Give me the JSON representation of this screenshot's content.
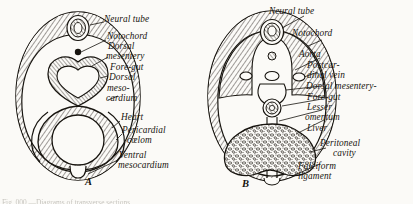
{
  "figure": {
    "panels": [
      {
        "letter": "A",
        "labels": [
          "Neural tube",
          "Notochord",
          "Dorsal",
          "mesentery",
          "Fore-gut",
          "Dorsal",
          "meso-",
          "cardium",
          "Heart",
          "Pericardial",
          "cœlom",
          "Ventral",
          "mesocardium"
        ]
      },
      {
        "letter": "B",
        "labels": [
          "Neural tube",
          "Notochord",
          "Aorta",
          "Postcar-",
          "dinal vein",
          "Dorsal mesentery-",
          "Fore-gut",
          "Lesser",
          "omentum",
          "Liver",
          "Peritoneal",
          "cavity",
          "Falciform",
          "ligament"
        ]
      }
    ],
    "caption": "Fig. 000.—Diagrams of transverse sections"
  },
  "panel_a": {
    "l1": "Neural tube",
    "l2": "Notochord",
    "l3": "Dorsal",
    "l4": "mesentery",
    "l5": "Fore-gut",
    "l6": "Dorsal",
    "l7": "meso-",
    "l8": "cardium",
    "l9": "Heart",
    "l10": "Pericardial",
    "l11": "cœlom",
    "l12": "Ventral",
    "l13": "mesocardium",
    "letter": "A"
  },
  "panel_b": {
    "l1": "Neural tube",
    "l2": "Notochord",
    "l3": "Aorta",
    "l4": "Postcar-",
    "l5": "dinal vein",
    "l6": "Dorsal mesentery-",
    "l7": "Fore-gut",
    "l8": "Lesser",
    "l9": "omentum",
    "l10": "Liver",
    "l11": "Peritoneal",
    "l12": "cavity",
    "l13": "Falciform",
    "l14": "ligament",
    "letter": "B"
  },
  "caption": {
    "text": "Fig. 000.—Diagrams of transverse sections"
  },
  "colors": {
    "background": "#fbfaf7",
    "ink": "#17140f",
    "hatch": "#2b2620"
  }
}
